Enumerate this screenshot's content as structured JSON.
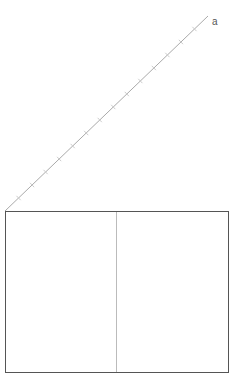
{
  "diagram": {
    "axis_label": "a",
    "axis": {
      "x1": 5,
      "y1": 211,
      "x2": 208,
      "y2": 16,
      "tick_count": 14,
      "color": "#aaaaaa"
    },
    "box": {
      "x": 5,
      "y": 211,
      "width": 223,
      "height": 161,
      "stroke": "#555555"
    },
    "divider": {
      "x": 116,
      "color": "#bbbbbb"
    }
  }
}
